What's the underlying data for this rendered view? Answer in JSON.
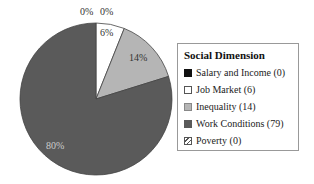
{
  "chart_data": {
    "type": "pie",
    "title": "",
    "legend_title": "Social Dimension",
    "legend_position": "right",
    "categories": [
      "Salary and Income",
      "Job Market",
      "Inequality",
      "Work Conditions",
      "Poverty"
    ],
    "values": [
      0,
      6,
      14,
      79,
      0
    ],
    "percent_labels": [
      "0%",
      "6%",
      "14%",
      "80%",
      "0%"
    ],
    "colors": [
      "#111111",
      "#ffffff",
      "#b5b5b5",
      "#5a5a5a",
      "#dddddd"
    ]
  },
  "legend": {
    "title": "Social Dimension",
    "items": [
      {
        "label": "Salary and Income (0)"
      },
      {
        "label": "Job Market (6)"
      },
      {
        "label": "Inequality (14)"
      },
      {
        "label": "Work Conditions (79)"
      },
      {
        "label": "Poverty (0)"
      }
    ]
  },
  "labels": {
    "salary": "0%",
    "poverty": "0%",
    "job": "6%",
    "inequality": "14%",
    "work": "80%"
  }
}
